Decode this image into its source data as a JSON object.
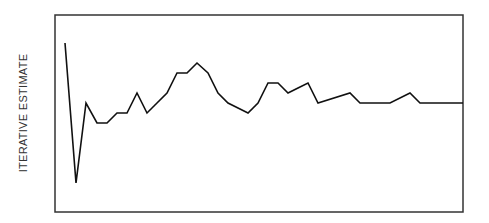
{
  "chart_data": {
    "type": "line",
    "title": "",
    "xlabel": "",
    "ylabel": "ITERATIVE ESTIMATE",
    "grid": false,
    "legend": null,
    "x": [
      1,
      2,
      3,
      4,
      5,
      6,
      7,
      8,
      9,
      10,
      11,
      12,
      13,
      14,
      15,
      16,
      17,
      18,
      19,
      20,
      21,
      22,
      23,
      24,
      25,
      26,
      27,
      28,
      29,
      30,
      31,
      32,
      33,
      34,
      35,
      36,
      37,
      38,
      39,
      40
    ],
    "values": [
      0.85,
      0.15,
      0.55,
      0.45,
      0.45,
      0.5,
      0.5,
      0.6,
      0.5,
      0.55,
      0.6,
      0.7,
      0.7,
      0.75,
      0.7,
      0.6,
      0.55,
      0.525,
      0.5,
      0.55,
      0.65,
      0.65,
      0.6,
      0.625,
      0.65,
      0.55,
      0.5625,
      0.575,
      0.6,
      0.55,
      0.55,
      0.55,
      0.55,
      0.575,
      0.6,
      0.55,
      0.55,
      0.55,
      0.55,
      0.55
    ],
    "points_px": [
      [
        65,
        43
      ],
      [
        76,
        183
      ],
      [
        86,
        103
      ],
      [
        97,
        123
      ],
      [
        107,
        123
      ],
      [
        117,
        113
      ],
      [
        127,
        113
      ],
      [
        137,
        93
      ],
      [
        147,
        113
      ],
      [
        157,
        103
      ],
      [
        167,
        93
      ],
      [
        177,
        73
      ],
      [
        187,
        73
      ],
      [
        197,
        63
      ],
      [
        208,
        73
      ],
      [
        218,
        93
      ],
      [
        228,
        103
      ],
      [
        238,
        108
      ],
      [
        248,
        113
      ],
      [
        258,
        103
      ],
      [
        268,
        83
      ],
      [
        278,
        83
      ],
      [
        288,
        93
      ],
      [
        298,
        88
      ],
      [
        308,
        83
      ],
      [
        318,
        103
      ],
      [
        350,
        93
      ],
      [
        360,
        103
      ],
      [
        390,
        103
      ],
      [
        410,
        93
      ],
      [
        420,
        103
      ],
      [
        463,
        103
      ]
    ],
    "frame": {
      "x": 55,
      "y": 15,
      "width": 408,
      "height": 197
    },
    "line_color": "#111111"
  }
}
